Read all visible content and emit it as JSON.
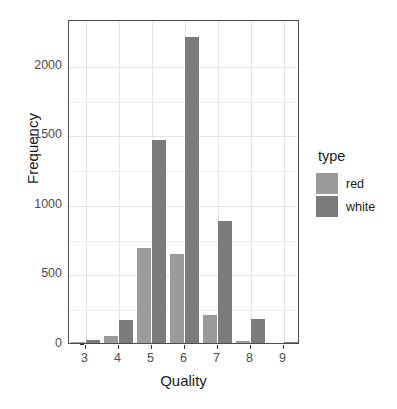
{
  "chart_data": {
    "type": "bar",
    "title": "",
    "xlabel": "Quality",
    "ylabel": "Frequency",
    "categories": [
      "3",
      "4",
      "5",
      "6",
      "7",
      "8",
      "9"
    ],
    "series": [
      {
        "name": "red",
        "color": "#9b9b9b",
        "values": [
          10,
          53,
          681,
          638,
          199,
          18,
          0
        ]
      },
      {
        "name": "white",
        "color": "#7b7b7b",
        "values": [
          20,
          163,
          1457,
          2198,
          880,
          175,
          5
        ]
      }
    ],
    "xlim": [
      2.5,
      9.5
    ],
    "ylim": [
      0,
      2330
    ],
    "yticks": [
      0,
      500,
      1000,
      1500,
      2000
    ],
    "ytick_labels": [
      "0",
      "500",
      "1000",
      "1500",
      "2000"
    ],
    "xticks": [
      3,
      4,
      5,
      6,
      7,
      8,
      9
    ],
    "xtick_labels": [
      "3",
      "4",
      "5",
      "6",
      "7",
      "8",
      "9"
    ],
    "grid": true,
    "grid_color": "#e6e6e6",
    "panel_background": "#ffffff",
    "panel_border_color": "#4d4d4d",
    "legend": {
      "title": "type",
      "position": "right",
      "entries": [
        {
          "label": "red",
          "color": "#9b9b9b"
        },
        {
          "label": "white",
          "color": "#7b7b7b"
        }
      ]
    }
  }
}
